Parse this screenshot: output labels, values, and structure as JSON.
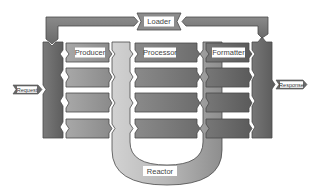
{
  "diagram": {
    "type": "pipeline-architecture",
    "nodes": {
      "loader": {
        "label": "Loader"
      },
      "producer": {
        "label": "Producer"
      },
      "processor": {
        "label": "Processor"
      },
      "formatter": {
        "label": "Formatter"
      },
      "reactor": {
        "label": "Reactor"
      },
      "request": {
        "label": "Request"
      },
      "response": {
        "label": "Response"
      }
    },
    "stages": [
      {
        "name": "Producer",
        "rows": 4
      },
      {
        "name": "Processor",
        "rows": 4
      },
      {
        "name": "Formatter",
        "rows": 4
      }
    ],
    "edges": [
      {
        "from": "Request",
        "to": "input-column"
      },
      {
        "from": "Loader",
        "to": "input-column"
      },
      {
        "from": "output-column",
        "to": "Loader"
      },
      {
        "from": "output-column",
        "to": "Response"
      },
      {
        "from": "Producer",
        "to": "Reactor"
      },
      {
        "from": "Reactor",
        "to": "Processor"
      },
      {
        "from": "Processor",
        "to": "Reactor"
      },
      {
        "from": "Reactor",
        "to": "Formatter"
      }
    ],
    "colors": {
      "dark": "#6e6e6e",
      "mid": "#8c8c8c",
      "light": "#bdbdbd",
      "outline": "#4a4a4a",
      "label_bg": "#ffffff"
    }
  }
}
